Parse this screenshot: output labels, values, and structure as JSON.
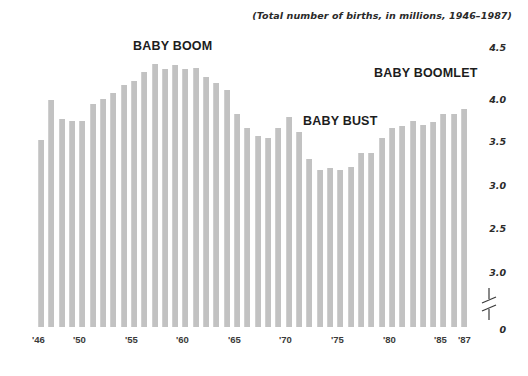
{
  "subtitle": "(Total number of births, in millions, 1946–1987)",
  "annotations": [
    {
      "id": "baby-boom",
      "label": "BABY BOOM"
    },
    {
      "id": "baby-boomlet",
      "label": "BABY BOOMLET"
    },
    {
      "id": "baby-bust",
      "label": "BABY BUST"
    }
  ],
  "y_axis": {
    "ticks": [
      {
        "label": "4.5",
        "y": 42
      },
      {
        "label": "4.0",
        "y": 94
      },
      {
        "label": "3.5",
        "y": 136
      },
      {
        "label": "3.0",
        "y": 180
      },
      {
        "label": "2.5",
        "y": 223
      },
      {
        "label": "3.0",
        "y": 267
      },
      {
        "label": "0",
        "y": 324
      }
    ],
    "break_symbol": "axis-break"
  },
  "x_axis": {
    "ticks": [
      {
        "label": "'46",
        "x": 32
      },
      {
        "label": "'50",
        "x": 73
      },
      {
        "label": "'55",
        "x": 125
      },
      {
        "label": "'60",
        "x": 176
      },
      {
        "label": "'65",
        "x": 228
      },
      {
        "label": "'70",
        "x": 279
      },
      {
        "label": "'75",
        "x": 331
      },
      {
        "label": "'80",
        "x": 383
      },
      {
        "label": "'85",
        "x": 434
      },
      {
        "label": "'87",
        "x": 458
      }
    ]
  },
  "colors": {
    "bar": "#c2c2c2",
    "text": "#1d1d1d",
    "background": "#ffffff"
  },
  "chart_data": {
    "type": "bar",
    "title": "",
    "subtitle": "(Total number of births, in millions, 1946–1987)",
    "xlabel": "",
    "ylabel": "",
    "ylim": [
      2.4,
      4.6
    ],
    "grid": false,
    "legend": null,
    "axis_broken_below": 2.4,
    "categories": [
      "1946",
      "1947",
      "1948",
      "1949",
      "1950",
      "1951",
      "1952",
      "1953",
      "1954",
      "1955",
      "1956",
      "1957",
      "1958",
      "1959",
      "1960",
      "1961",
      "1962",
      "1963",
      "1964",
      "1965",
      "1966",
      "1967",
      "1968",
      "1969",
      "1970",
      "1971",
      "1972",
      "1973",
      "1974",
      "1975",
      "1976",
      "1977",
      "1978",
      "1979",
      "1980",
      "1981",
      "1982",
      "1983",
      "1984",
      "1985",
      "1986",
      "1987"
    ],
    "values": [
      3.47,
      3.92,
      3.7,
      3.68,
      3.68,
      3.87,
      3.93,
      3.99,
      4.08,
      4.12,
      4.22,
      4.31,
      4.26,
      4.3,
      4.26,
      4.27,
      4.17,
      4.1,
      4.03,
      3.76,
      3.61,
      3.52,
      3.5,
      3.6,
      3.73,
      3.56,
      3.26,
      3.14,
      3.16,
      3.14,
      3.17,
      3.33,
      3.33,
      3.49,
      3.61,
      3.63,
      3.68,
      3.64,
      3.67,
      3.76,
      3.76,
      3.81
    ],
    "annotations": [
      {
        "text": "BABY BOOM",
        "near_year": "1957"
      },
      {
        "text": "BABY BUST",
        "near_year": "1974"
      },
      {
        "text": "BABY BOOMLET",
        "near_year": "1985"
      }
    ]
  }
}
